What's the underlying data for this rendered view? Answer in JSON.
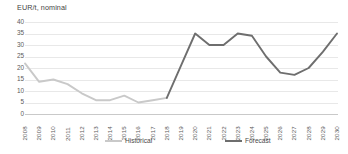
{
  "chart_data": {
    "type": "line",
    "title": "EUR/t, nominal",
    "xlabel": "",
    "ylabel": "EUR/t, nominal",
    "ylim": [
      0,
      40
    ],
    "yticks": [
      40,
      35,
      30,
      25,
      20,
      15,
      10,
      5,
      0
    ],
    "grid": true,
    "legend_position": "bottom",
    "categories": [
      "2008",
      "2009",
      "2010",
      "2011",
      "2012",
      "2013",
      "2014",
      "2015",
      "2016",
      "2017",
      "2018",
      "2019",
      "2020",
      "2021",
      "2022",
      "2023",
      "2024",
      "2025",
      "2026",
      "2027",
      "2028",
      "2029",
      "2030"
    ],
    "series": [
      {
        "name": "Historical",
        "color": "#c9c9c9",
        "values": [
          22,
          14,
          15,
          13,
          9,
          6,
          6,
          8,
          5,
          6,
          7,
          null,
          null,
          null,
          null,
          null,
          null,
          null,
          null,
          null,
          null,
          null,
          null
        ]
      },
      {
        "name": "Forecast",
        "color": "#6e6e6e",
        "values": [
          null,
          null,
          null,
          null,
          null,
          null,
          null,
          null,
          null,
          null,
          7,
          21,
          35,
          30,
          30,
          35,
          34,
          25,
          18,
          17,
          20,
          27,
          35
        ]
      }
    ],
    "legend": [
      {
        "label": "Historical",
        "color": "#c9c9c9"
      },
      {
        "label": "Forecast",
        "color": "#6e6e6e"
      }
    ]
  }
}
